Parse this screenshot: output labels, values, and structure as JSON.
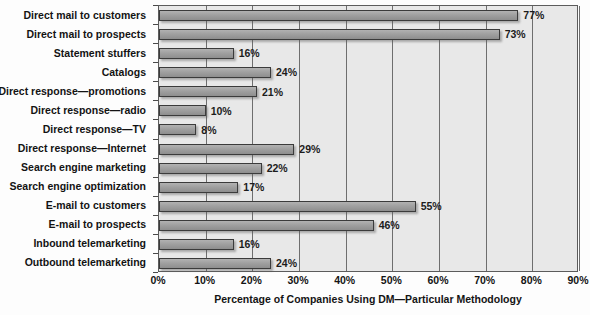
{
  "chart_data": {
    "type": "bar",
    "orientation": "horizontal",
    "title": "",
    "xlabel": "Percentage of Companies Using DM—Particular Methodology",
    "ylabel": "",
    "xlim": [
      0,
      90
    ],
    "xticks": [
      "0%",
      "10%",
      "20%",
      "30%",
      "40%",
      "50%",
      "60%",
      "70%",
      "80%",
      "90%"
    ],
    "xtick_values": [
      0,
      10,
      20,
      30,
      40,
      50,
      60,
      70,
      80,
      90
    ],
    "grid": "vertical",
    "legend": "none",
    "categories": [
      "Direct mail to customers",
      "Direct mail to prospects",
      "Statement stuffers",
      "Catalogs",
      "Direct response—promotions",
      "Direct response—radio",
      "Direct response—TV",
      "Direct response—Internet",
      "Search engine marketing",
      "Search engine optimization",
      "E-mail to customers",
      "E-mail to prospects",
      "Inbound telemarketing",
      "Outbound telemarketing"
    ],
    "values": [
      77,
      73,
      16,
      24,
      21,
      10,
      8,
      29,
      22,
      17,
      55,
      46,
      16,
      24
    ],
    "data_labels": [
      "77%",
      "73%",
      "16%",
      "24%",
      "21%",
      "10%",
      "8%",
      "29%",
      "22%",
      "17%",
      "55%",
      "46%",
      "16%",
      "24%"
    ]
  },
  "colors": {
    "bar_fill": "#a0a0a0",
    "bar_border": "#3b3b3b",
    "plot_background": "#e8e8e8",
    "gridline": "#6e6e6e",
    "text": "#141414"
  }
}
